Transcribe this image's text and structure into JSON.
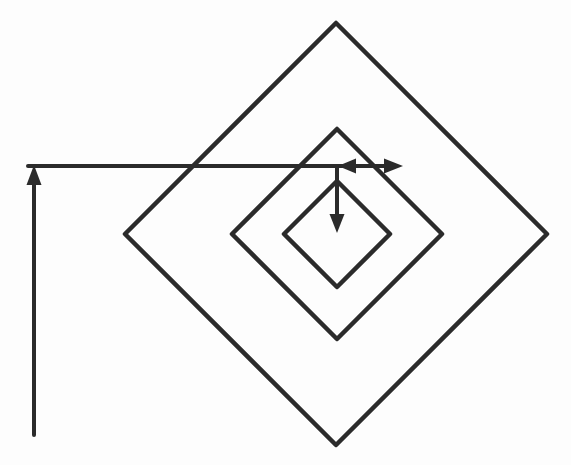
{
  "figure": {
    "background_color": "#fdfdfd",
    "line_color": "#2b2b2b",
    "canvas_width": "571",
    "canvas_height": "465",
    "view_box": "0 0 571 465"
  },
  "diamonds": {
    "outer": {
      "label": "outer rotated square",
      "center_x": 336,
      "center_y": 234,
      "half_diagonal": 211,
      "points": "336,23 547,234 336,445 125,234"
    },
    "middle": {
      "label": "middle rotated square",
      "center_x": 337,
      "center_y": 234,
      "half_diagonal": 105,
      "points": "337,129 442,234 337,339 232,234"
    },
    "inner": {
      "label": "inner rotated square",
      "center_x": 337,
      "center_y": 234,
      "half_diagonal": 53,
      "points": "337,181 390,234 337,287 284,234"
    }
  },
  "arrows": {
    "up_left_axis": {
      "direction": "up",
      "shaft": "M 34 435 L 34 184",
      "head": "34,165 26.5,185 41.5,185"
    },
    "long_right": {
      "direction": "right",
      "shaft": "M 28 166 L 386 166",
      "head": "403,166 384,158.5 384,173.5"
    },
    "step_left": {
      "direction": "left",
      "shaft": "M 384 166 L 354 166",
      "head": "338,166 356,158.5 356,173.5"
    },
    "step_down_to_center": {
      "direction": "down",
      "shaft": "M 337 168 L 337 216",
      "head": "337,233 329.5,214 344.5,214"
    }
  }
}
